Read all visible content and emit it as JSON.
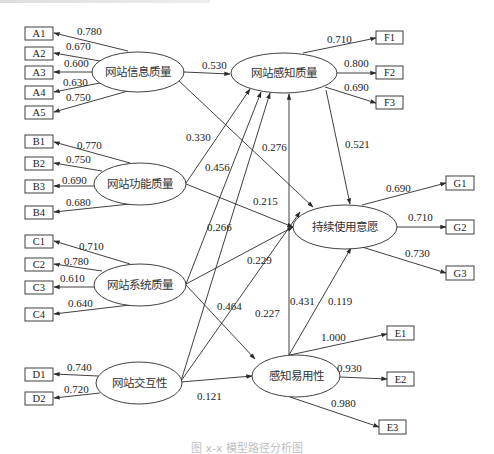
{
  "caption": "图 x-x 模型路径分析图",
  "latent": {
    "info": "网站信息质量",
    "func": "网站功能质量",
    "sys": "网站系统质量",
    "inter": "网站交互性",
    "pq": "网站感知质量",
    "ci": "持续使用意愿",
    "peou": "感知易用性"
  },
  "indicators": {
    "A": [
      {
        "name": "A1",
        "loading": "0.780"
      },
      {
        "name": "A2",
        "loading": "0.670"
      },
      {
        "name": "A3",
        "loading": "0.600"
      },
      {
        "name": "A4",
        "loading": "0.630"
      },
      {
        "name": "A5",
        "loading": "0.750"
      }
    ],
    "B": [
      {
        "name": "B1",
        "loading": "0.770"
      },
      {
        "name": "B2",
        "loading": "0.750"
      },
      {
        "name": "B3",
        "loading": "0.690"
      },
      {
        "name": "B4",
        "loading": "0.680"
      }
    ],
    "C": [
      {
        "name": "C1",
        "loading": "0.710"
      },
      {
        "name": "C2",
        "loading": "0.780"
      },
      {
        "name": "C3",
        "loading": "0.610"
      },
      {
        "name": "C4",
        "loading": "0.640"
      }
    ],
    "D": [
      {
        "name": "D1",
        "loading": "0.740"
      },
      {
        "name": "D2",
        "loading": "0.720"
      }
    ],
    "F": [
      {
        "name": "F1",
        "loading": "0.710"
      },
      {
        "name": "F2",
        "loading": "0.800"
      },
      {
        "name": "F3",
        "loading": "0.690"
      }
    ],
    "G": [
      {
        "name": "G1",
        "loading": "0.690"
      },
      {
        "name": "G2",
        "loading": "0.710"
      },
      {
        "name": "G3",
        "loading": "0.730"
      }
    ],
    "E": [
      {
        "name": "E1",
        "loading": "1.000"
      },
      {
        "name": "E2",
        "loading": "0.930"
      },
      {
        "name": "E3",
        "loading": "0.980"
      }
    ]
  },
  "paths": {
    "info_pq": "0.530",
    "info_ci": "0.276",
    "func_pq": "0.330",
    "func_ci": "0.215",
    "sys_pq": "0.456",
    "sys_ci": "0.229",
    "sys_peou": "0.464",
    "inter_pq": "0.266",
    "inter_ci": "0.227",
    "inter_peou": "0.121",
    "pq_ci": "0.521",
    "peou_pq": "0.431",
    "peou_ci": "0.119"
  }
}
